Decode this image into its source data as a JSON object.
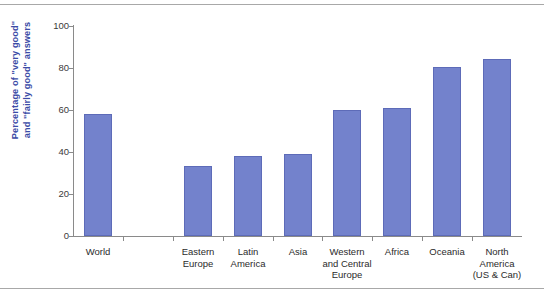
{
  "chart_data": {
    "type": "bar",
    "title": "",
    "xlabel": "",
    "ylabel": "Percentage of \"very good\" and \"fairly good\" answers",
    "ylabel_lines": [
      "Percentage of \"very good\"",
      "and \"fairly good\" answers"
    ],
    "categories": [
      "World",
      "",
      "Eastern Europe",
      "Latin America",
      "Asia",
      "Western and Central Europe",
      "Africa",
      "Oceania",
      "North America (US & Can)"
    ],
    "category_lines": [
      [
        "World"
      ],
      [
        ""
      ],
      [
        "Eastern",
        "Europe"
      ],
      [
        "Latin",
        "America"
      ],
      [
        "Asia"
      ],
      [
        "Western",
        "and Central",
        "Europe"
      ],
      [
        "Africa"
      ],
      [
        "Oceania"
      ],
      [
        "North",
        "America",
        "(US & Can)"
      ]
    ],
    "values": [
      58,
      null,
      33.5,
      38,
      39,
      60,
      61,
      80.5,
      84.5
    ],
    "ylim": [
      0,
      100
    ],
    "yticks": [
      0,
      20,
      40,
      60,
      80,
      100
    ],
    "ytick_labels": [
      "0",
      "20",
      "40",
      "60",
      "80",
      "100"
    ],
    "grid": false,
    "legend": null,
    "bar_color": "#7382CC",
    "bar_edge_color": "#5D6BB8",
    "axis_color": "#8A8A8A",
    "ylabel_color": "#3B4BA6",
    "tick_label_color": "#3A3A3A",
    "rule_color": "#A8A8A8"
  }
}
